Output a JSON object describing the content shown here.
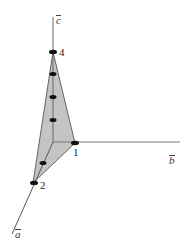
{
  "diagram": {
    "type": "3d-axes-plane",
    "colors": {
      "axis": "#777777",
      "edge": "#444444",
      "fill": "#c4c4c4",
      "point": "#111111"
    },
    "axes": [
      {
        "id": "a",
        "label": "a",
        "decoration": "overbar",
        "direction": "down-left"
      },
      {
        "id": "b",
        "label": "b",
        "decoration": "overbar",
        "direction": "right"
      },
      {
        "id": "c",
        "label": "c",
        "decoration": "overbar",
        "direction": "up"
      }
    ],
    "intercepts": [
      {
        "axis": "a",
        "label": "2"
      },
      {
        "axis": "b",
        "label": "1"
      },
      {
        "axis": "c",
        "label": "4"
      }
    ],
    "points_on_c_axis": 4,
    "points_on_a_axis": 2,
    "points_on_b_axis": 1
  }
}
